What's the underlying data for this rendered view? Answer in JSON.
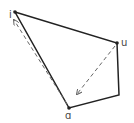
{
  "diagram": {
    "type": "vowel-quadrilateral",
    "labels": {
      "i": "i",
      "u": "u",
      "a": "ɑ"
    },
    "points": {
      "i": [
        15,
        12
      ],
      "u": [
        117,
        43
      ],
      "corner": [
        119,
        95
      ],
      "a": [
        69,
        108
      ]
    },
    "arrows": [
      {
        "from": "ɑ",
        "to": "i",
        "style": "dashed"
      },
      {
        "from": "u",
        "to": "ɑ",
        "style": "dashed"
      }
    ],
    "colors": {
      "line": "#222222",
      "dashed": "#666666"
    }
  }
}
